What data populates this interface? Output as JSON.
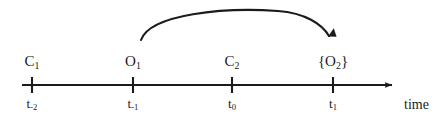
{
  "diagram": {
    "type": "timeline",
    "title_visible": false,
    "background_color": "#ffffff",
    "stroke_color": "#1b1b1b",
    "axis": {
      "name": "time",
      "name_x": 404,
      "name_y": 98,
      "line_y": 85,
      "line_start_x": 22,
      "line_end_x": 399,
      "has_arrowhead": true,
      "arrow_direction": "right"
    },
    "ticks": [
      {
        "id": "tick-t-minus-2",
        "x": 32,
        "event_label": "C",
        "event_sub": "1",
        "event_full": "C₁",
        "time_label": "t",
        "time_sub": "-2",
        "time_full": "t₋₂"
      },
      {
        "id": "tick-t-minus-1",
        "x": 133,
        "event_label": "O",
        "event_sub": "1",
        "event_full": "O₁",
        "time_label": "t",
        "time_sub": "-1",
        "time_full": "t₋₁"
      },
      {
        "id": "tick-t-zero",
        "x": 232,
        "event_label": "C",
        "event_sub": "2",
        "event_full": "C₂",
        "time_label": "t",
        "time_sub": "0",
        "time_full": "t₀"
      },
      {
        "id": "tick-t-one",
        "x": 333,
        "event_label": "{O",
        "event_sub": "2",
        "event_suffix": "}",
        "event_full": "{O₂}",
        "time_label": "t",
        "time_sub": "1",
        "time_full": "t₁"
      }
    ],
    "arc": {
      "id": "curved-arrow",
      "from_tick": "tick-t-minus-1",
      "to_tick": "tick-t-one",
      "start_x": 141,
      "start_y": 40,
      "apex_y": 12,
      "end_x": 331,
      "end_y": 45,
      "has_arrowhead": true,
      "arrow_direction": "down"
    }
  }
}
